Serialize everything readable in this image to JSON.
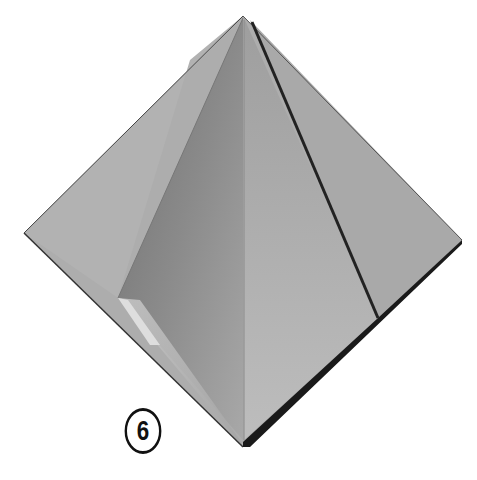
{
  "figure": {
    "step_number": "6",
    "colors": {
      "background": "#ffffff",
      "paper_light": "#b4b4b4",
      "paper_mid": "#a2a2a2",
      "paper_dark": "#7e7e7e",
      "paper_highlight": "#d8d8d8",
      "crease_dark": "#1a1a1a",
      "badge_stroke": "#111111"
    }
  }
}
